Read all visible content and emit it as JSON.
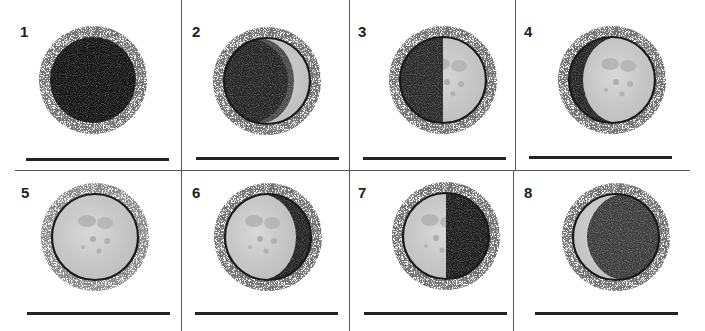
{
  "worksheet": {
    "title": "Moon phases",
    "panels": [
      {
        "number": "1",
        "phase": "new-moon",
        "lit": "none"
      },
      {
        "number": "2",
        "phase": "waxing-crescent",
        "lit": "right-crescent"
      },
      {
        "number": "3",
        "phase": "first-quarter",
        "lit": "right-half"
      },
      {
        "number": "4",
        "phase": "waxing-gibbous",
        "lit": "right-gibbous"
      },
      {
        "number": "5",
        "phase": "full-moon",
        "lit": "full"
      },
      {
        "number": "6",
        "phase": "waning-gibbous",
        "lit": "left-gibbous"
      },
      {
        "number": "7",
        "phase": "last-quarter",
        "lit": "left-half"
      },
      {
        "number": "8",
        "phase": "waning-crescent",
        "lit": "left-crescent"
      }
    ],
    "answer_values": [
      "",
      "",
      "",
      "",
      "",
      "",
      "",
      ""
    ]
  },
  "colors": {
    "dark": "#151515",
    "lit": "#cfcfcf",
    "lit_shade": "#b4b4b4",
    "outline": "#1a1a1a"
  }
}
